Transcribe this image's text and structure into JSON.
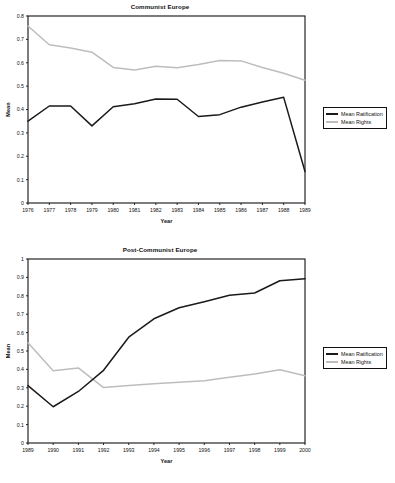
{
  "charts": {
    "communist": {
      "title": "Communist Europe",
      "xlabel": "Year",
      "ylabel": "Mean",
      "legend": {
        "ratification_label": "Mean Ratification",
        "rights_label": "Mean Rights"
      }
    },
    "postcommunist": {
      "title": "Post-Communist Europe",
      "xlabel": "Year",
      "ylabel": "Mean",
      "legend": {
        "ratification_label": "Mean Ratification",
        "rights_label": "Mean Rights"
      }
    }
  },
  "colors": {
    "ratification": "#1a1a1a",
    "rights": "#bdbdbd",
    "frame": "#111111"
  },
  "chart_data": [
    {
      "type": "line",
      "title": "Communist Europe",
      "xlabel": "Year",
      "ylabel": "Mean",
      "grid": false,
      "legend_position": "right",
      "x": [
        1976,
        1977,
        1978,
        1979,
        1980,
        1981,
        1982,
        1983,
        1984,
        1985,
        1986,
        1987,
        1988,
        1989
      ],
      "categories": [
        "1976",
        "1977",
        "1978",
        "1979",
        "1980",
        "1981",
        "1982",
        "1983",
        "1984",
        "1985",
        "1986",
        "1987",
        "1988",
        "1989"
      ],
      "xlim": [
        1976,
        1989
      ],
      "ylim": [
        0,
        0.8
      ],
      "yticks": [
        "0",
        "0.1",
        "0.2",
        "0.3",
        "0.4",
        "0.5",
        "0.6",
        "0.7",
        "0.8"
      ],
      "series": [
        {
          "name": "Mean Ratification",
          "color": "#1a1a1a",
          "values": [
            0.35,
            0.415,
            0.415,
            0.33,
            0.412,
            0.425,
            0.445,
            0.444,
            0.37,
            0.378,
            0.41,
            0.432,
            0.452,
            0.135
          ]
        },
        {
          "name": "Mean Rights",
          "color": "#bdbdbd",
          "values": [
            0.757,
            0.677,
            0.663,
            0.645,
            0.58,
            0.569,
            0.585,
            0.579,
            0.593,
            0.61,
            0.608,
            0.58,
            0.555,
            0.525
          ]
        }
      ]
    },
    {
      "type": "line",
      "title": "Post-Communist Europe",
      "xlabel": "Year",
      "ylabel": "Mean",
      "grid": false,
      "legend_position": "right",
      "x": [
        1989,
        1990,
        1991,
        1992,
        1993,
        1994,
        1995,
        1996,
        1997,
        1998,
        1999,
        2000
      ],
      "categories": [
        "1989",
        "1990",
        "1991",
        "1992",
        "1993",
        "1994",
        "1995",
        "1996",
        "1997",
        "1998",
        "1999",
        "2000"
      ],
      "xlim": [
        1989,
        2000
      ],
      "ylim": [
        0,
        1
      ],
      "yticks": [
        "0",
        "0.1",
        "0.2",
        "0.3",
        "0.4",
        "0.5",
        "0.6",
        "0.7",
        "0.8",
        "0.9",
        "1"
      ],
      "series": [
        {
          "name": "Mean Ratification",
          "color": "#1a1a1a",
          "values": [
            0.312,
            0.197,
            0.28,
            0.395,
            0.575,
            0.675,
            0.735,
            0.768,
            0.803,
            0.815,
            0.882,
            0.893
          ]
        },
        {
          "name": "Mean Rights",
          "color": "#bdbdbd",
          "values": [
            0.545,
            0.393,
            0.408,
            0.301,
            0.313,
            0.322,
            0.33,
            0.338,
            0.357,
            0.375,
            0.398,
            0.365
          ]
        }
      ]
    }
  ]
}
